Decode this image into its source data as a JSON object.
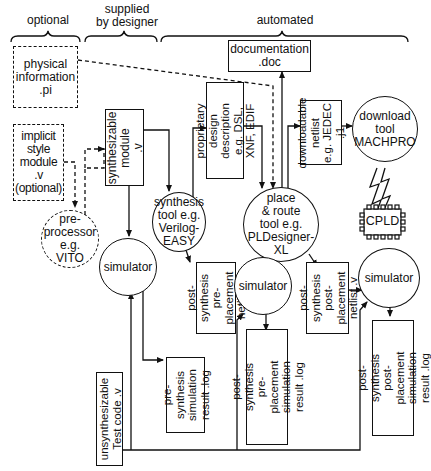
{
  "header": {
    "optional": "optional",
    "supplied_by_designer": "supplied\nby designer",
    "automated": "automated"
  },
  "nodes": {
    "physical_information": "physical\ninformation\n.pi",
    "implicit_style_module": "implicit\nstyle\nmodule\n.v\n(optional)",
    "preprocessor": "pre-\nprocessor\ne.g.\nVITO",
    "synthesizable_module": "synthesizable\nmodule\n.v",
    "simulator_1": "simulator",
    "synthesis_tool": "synthesis\ntool e.g.\nVerilog-\nEASY",
    "proprietary_design": "proprietary design\ndescription e.g. DSL,\nXNF, EDIF",
    "documentation": "documentation\n.doc",
    "place_route_tool": "place\n& route\ntool e.g.\nPLDesigner-\nXL",
    "downloadable_netlist": "downloadable\nnetlist\ne.g. JEDEC .j1",
    "download_tool": "download\ntool\nMACHPRO",
    "cpld": "CPLD",
    "post_synth_pre_place_netlist": "post-synthesis\npre-placement\nnetlist .v",
    "simulator_2": "simulator",
    "post_synth_post_place_netlist": "post-synthesis\npost-placement\nnetlist .v",
    "simulator_3": "simulator",
    "pre_synth_sim_result": "pre-synthesis\nsimulation\nresult .log",
    "post_synth_pre_place_sim_result": "post-synthesis\npre-placement\nsimulation result .log",
    "post_synth_post_place_sim_result": "post-synthesis\npost-placement\nsimulation result .log",
    "unsynthesizable_test_code": "unsynthesizable\nTest code .v"
  },
  "colors": {
    "line": "#111111",
    "background": "#ffffff"
  }
}
